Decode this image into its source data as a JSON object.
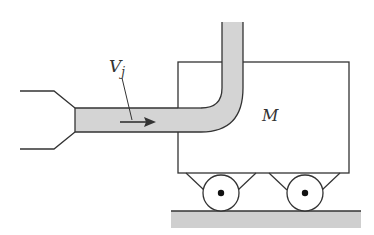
{
  "diagram": {
    "type": "physics-free-body",
    "labels": {
      "jet_velocity": "V",
      "jet_velocity_sub": "j",
      "cart_mass": "M"
    },
    "components": [
      "nozzle",
      "horizontal-jet-pipe",
      "90-degree-bend",
      "vertical-pipe",
      "cart-box",
      "wheel-left",
      "wheel-right",
      "ground"
    ],
    "colors": {
      "stroke": "#333333",
      "fluid_fill": "#d4d4d4",
      "ground_fill": "#cfcfcf",
      "background": "#ffffff"
    }
  }
}
